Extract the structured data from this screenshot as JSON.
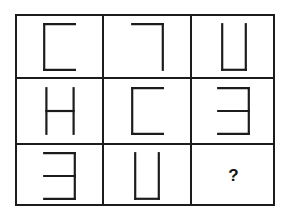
{
  "puzzle": {
    "type": "matrix-reasoning",
    "title": "Three by three figure matrix with missing element",
    "grid": {
      "rows": 3,
      "columns": 3
    },
    "style": {
      "background_color": "#ffffff",
      "stroke_color": "#1c1c1c",
      "border_color": "#1c1c1c",
      "stroke_width": 2
    },
    "cells": [
      {
        "id": "cell-r1c1",
        "row": 1,
        "column": 1,
        "shape": "bracket-open-right",
        "shape_label": "C",
        "description": "Square bracket open to the right: left vertical stroke with top and bottom horizontal strokes",
        "strokes": [
          "left",
          "top",
          "bottom"
        ],
        "width": 33,
        "height": 48
      },
      {
        "id": "cell-r1c2",
        "row": 1,
        "column": 2,
        "shape": "corner-top-right",
        "shape_label": "7",
        "description": "Corner shape: top horizontal stroke joined to right vertical stroke",
        "strokes": [
          "top",
          "right"
        ],
        "width": 33,
        "height": 48
      },
      {
        "id": "cell-r1c3",
        "row": 1,
        "column": 3,
        "shape": "bracket-open-top",
        "shape_label": "U",
        "description": "Square bracket open at the top: left vertical, bottom horizontal and right vertical strokes",
        "strokes": [
          "left",
          "bottom",
          "right"
        ],
        "width": 26,
        "height": 48
      },
      {
        "id": "cell-r2c1",
        "row": 2,
        "column": 1,
        "shape": "h-shape",
        "shape_label": "H",
        "description": "Two vertical strokes joined by a middle horizontal stroke",
        "strokes": [
          "left",
          "right",
          "middle"
        ],
        "width": 30,
        "height": 48
      },
      {
        "id": "cell-r2c2",
        "row": 2,
        "column": 2,
        "shape": "bracket-open-right",
        "shape_label": "C",
        "description": "Square bracket open to the right: left vertical stroke with top and bottom horizontal strokes",
        "strokes": [
          "left",
          "top",
          "bottom"
        ],
        "width": 33,
        "height": 48
      },
      {
        "id": "cell-r2c3",
        "row": 2,
        "column": 3,
        "shape": "mirrored-e",
        "shape_label": "E reversed",
        "description": "Mirrored E: right vertical stroke with top, middle and bottom horizontal strokes extending left",
        "strokes": [
          "right",
          "top",
          "middle",
          "bottom"
        ],
        "width": 33,
        "height": 48
      },
      {
        "id": "cell-r3c1",
        "row": 3,
        "column": 1,
        "shape": "mirrored-e",
        "shape_label": "E reversed",
        "description": "Mirrored E: right vertical stroke with top, middle and bottom horizontal strokes extending left",
        "strokes": [
          "right",
          "top",
          "middle",
          "bottom"
        ],
        "width": 33,
        "height": 48
      },
      {
        "id": "cell-r3c2",
        "row": 3,
        "column": 2,
        "shape": "bracket-open-top",
        "shape_label": "U",
        "description": "Square bracket open at the top: left vertical, bottom horizontal and right vertical strokes",
        "strokes": [
          "left",
          "bottom",
          "right"
        ],
        "width": 26,
        "height": 48
      },
      {
        "id": "cell-r3c3",
        "row": 3,
        "column": 3,
        "shape": "question-mark",
        "shape_label": "?",
        "description": "Missing element marked with a bold question mark",
        "strokes": [],
        "width": 0,
        "height": 0
      }
    ],
    "missing_cell_marker": "?"
  }
}
